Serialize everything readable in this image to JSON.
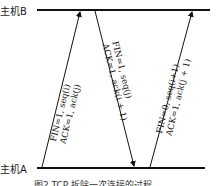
{
  "hosts": {
    "b": "主机B",
    "a": "主机A"
  },
  "messages": [
    {
      "line1": "FIN=1, seq(i)",
      "line2": "ACK=1, ack(j)",
      "direction": "A→B"
    },
    {
      "line1": "FIN=1, seq(j)",
      "line2": "ACK=1, ack(i + 1)",
      "direction": "B→A"
    },
    {
      "line1": "FIN=0, seq(i+1)",
      "line2": "ACK=1, ack(j + 1)",
      "direction": "A→B"
    }
  ],
  "caption": "图2  TCP 拆除一次连接的过程"
}
